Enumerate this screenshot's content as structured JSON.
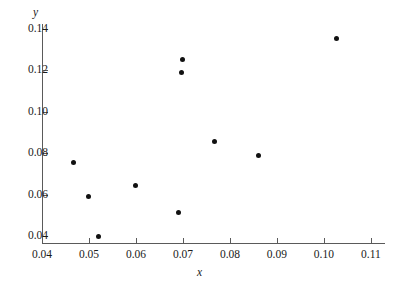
{
  "chart_data": {
    "type": "scatter",
    "title": "",
    "xlabel": "x",
    "ylabel": "y",
    "xlim": [
      0.04,
      0.113
    ],
    "ylim": [
      0.0355,
      0.1455
    ],
    "grid": false,
    "legend": null,
    "xticks": [
      0.04,
      0.05,
      0.06,
      0.07,
      0.08,
      0.09,
      0.1,
      0.11
    ],
    "xtick_labels": [
      "0.04",
      "0.05",
      "0.06",
      "0.07",
      "0.08",
      "0.09",
      "0.10",
      "0.11"
    ],
    "yticks": [
      0.04,
      0.06,
      0.08,
      0.1,
      0.12,
      0.14
    ],
    "ytick_labels": [
      "0.04",
      "0.06",
      "0.08",
      "0.10",
      "0.12",
      "0.14"
    ],
    "series": [
      {
        "name": "observations",
        "marker": "filled-circle",
        "color": "#111111",
        "points": [
          {
            "x": 0.0468,
            "y": 0.0757
          },
          {
            "x": 0.05,
            "y": 0.0589
          },
          {
            "x": 0.052,
            "y": 0.04
          },
          {
            "x": 0.0599,
            "y": 0.0645
          },
          {
            "x": 0.069,
            "y": 0.0512
          },
          {
            "x": 0.0697,
            "y": 0.119
          },
          {
            "x": 0.0699,
            "y": 0.1253
          },
          {
            "x": 0.0767,
            "y": 0.0855
          },
          {
            "x": 0.086,
            "y": 0.079
          },
          {
            "x": 0.1026,
            "y": 0.1354
          }
        ]
      }
    ]
  },
  "axes": {
    "x_title": "x",
    "y_title": "y"
  },
  "colors": {
    "marker": "#111111",
    "axis": "#5a5a5a",
    "text": "#1a1a1a",
    "background": "#ffffff"
  }
}
